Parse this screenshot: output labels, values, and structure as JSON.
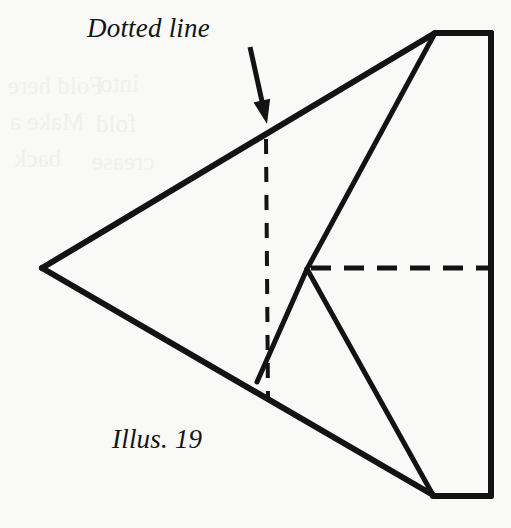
{
  "figure": {
    "caption": "Illus. 19",
    "annotation_label": "Dotted line",
    "background_color": "#f9f9f8",
    "ink_color": "#131313",
    "canvas": {
      "width": 511,
      "height": 528
    },
    "solid_lines": [
      {
        "name": "upper-left-fold-edge",
        "x1": 42,
        "y1": 268,
        "x2": 435,
        "y2": 33,
        "width": 6
      },
      {
        "name": "lower-left-fold-edge",
        "x1": 42,
        "y1": 268,
        "x2": 433,
        "y2": 495,
        "width": 6
      },
      {
        "name": "right-upper-crease",
        "x1": 435,
        "y1": 33,
        "x2": 307,
        "y2": 269,
        "width": 5
      },
      {
        "name": "right-lower-crease",
        "x1": 307,
        "y1": 269,
        "x2": 433,
        "y2": 495,
        "width": 5
      },
      {
        "name": "short-left-crease",
        "x1": 307,
        "y1": 269,
        "x2": 257,
        "y2": 382,
        "width": 5
      },
      {
        "name": "rectangle-top-edge",
        "x1": 435,
        "y1": 33,
        "x2": 491,
        "y2": 33,
        "width": 6
      },
      {
        "name": "rectangle-right-edge",
        "x1": 491,
        "y1": 33,
        "x2": 491,
        "y2": 496,
        "width": 6
      },
      {
        "name": "rectangle-bottom-edge",
        "x1": 433,
        "y1": 496,
        "x2": 491,
        "y2": 496,
        "width": 6
      }
    ],
    "dashed_lines": [
      {
        "name": "vertical-dotted-line",
        "x1": 266,
        "y1": 139,
        "x2": 268,
        "y2": 398,
        "width": 4,
        "dash": "15 13"
      },
      {
        "name": "horizontal-dotted-line",
        "x1": 311,
        "y1": 268,
        "x2": 488,
        "y2": 268,
        "width": 5,
        "dash": "20 13"
      }
    ],
    "arrow": {
      "name": "annotation-arrow",
      "x1": 250,
      "y1": 47,
      "x2": 267,
      "y2": 124,
      "width": 5,
      "head_width": 17,
      "head_length": 24
    },
    "bleed_through_lines": [
      {
        "text": "Fold here",
        "left": 8,
        "top": 72
      },
      {
        "text": "Make a",
        "left": 10,
        "top": 108
      },
      {
        "text": "back",
        "left": 14,
        "top": 145
      },
      {
        "text": "into",
        "left": 100,
        "top": 70
      },
      {
        "text": "fold",
        "left": 96,
        "top": 110
      },
      {
        "text": "crease",
        "left": 92,
        "top": 148
      }
    ]
  }
}
